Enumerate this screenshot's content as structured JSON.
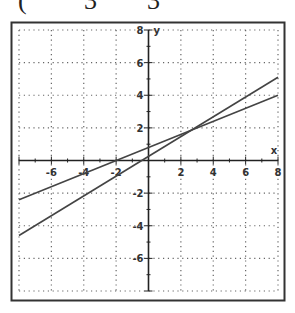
{
  "header_fragment": {
    "paren": "(",
    "denom1": "3",
    "denom2": "3"
  },
  "chart_data": {
    "type": "line",
    "title": "",
    "xlabel": "x",
    "ylabel": "y",
    "xlim": [
      -8,
      8
    ],
    "ylim": [
      -8,
      8
    ],
    "grid": true,
    "grid_style": "dotted",
    "x_ticks": [
      -6,
      -4,
      -2,
      2,
      4,
      6,
      8
    ],
    "y_ticks": [
      8,
      6,
      4,
      2,
      -2,
      -4,
      -6
    ],
    "series": [
      {
        "name": "line-1",
        "x": [
          -8,
          8
        ],
        "y": [
          -4.6,
          5.1
        ]
      },
      {
        "name": "line-2",
        "x": [
          -8,
          8
        ],
        "y": [
          -2.4,
          4.0
        ]
      }
    ]
  },
  "colors": {
    "line": "#444444",
    "grid": "#666666",
    "axis": "#222222",
    "frame": "#333333"
  }
}
